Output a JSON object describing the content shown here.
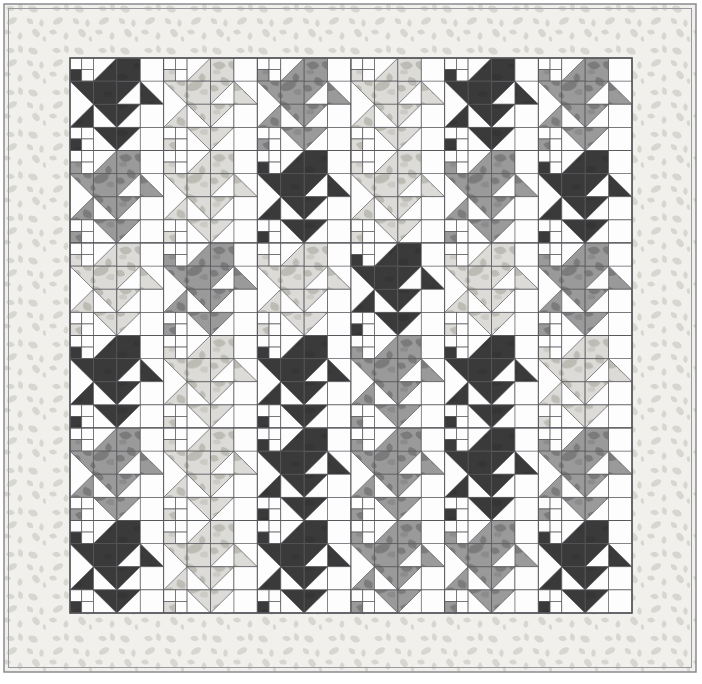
{
  "document": {
    "kind": "quilt-design-layout",
    "title": "Scottie Dog / Puppy Block Quilt Layout",
    "canvas": {
      "width": 702,
      "height": 684,
      "background": "#ffffff"
    }
  },
  "palette": {
    "dark": "#3a3a3a",
    "medium": "#9a9a9a",
    "medium_motif": "#7e7e7e",
    "light": "#dcdcd8",
    "light_motif": "#bcbcb6",
    "white": "#fdfdfd",
    "border_fabric": "#f1f0ec",
    "border_motif": "#d5d6cf",
    "seam_line": "#55555a",
    "outline": "#6b6b70"
  },
  "frame": {
    "outer": {
      "x": 4,
      "y": 4,
      "width": 692,
      "height": 668
    },
    "inner": {
      "x": 70,
      "y": 58,
      "width": 562,
      "height": 555
    },
    "border_width_left": 66,
    "border_width_top": 54,
    "border_width_right": 64,
    "border_width_bottom": 59
  },
  "quilt": {
    "block_columns": 6,
    "block_rows": 6,
    "block_width": 93.67,
    "block_height": 92.5,
    "units_per_block": 4,
    "block_name": "puppy-block"
  },
  "chart_data": {
    "type": "heatmap",
    "xlabel": "block column",
    "ylabel": "block row",
    "categories": [
      "C1",
      "C2",
      "C3",
      "C4",
      "C5",
      "C6"
    ],
    "rows": [
      "R1",
      "R2",
      "R3",
      "R4",
      "R5",
      "R6"
    ],
    "legend": [
      "dark",
      "medium",
      "light",
      "white"
    ],
    "values": [
      [
        "dark",
        "light",
        "medium",
        "light",
        "dark",
        "medium"
      ],
      [
        "medium",
        "light",
        "dark",
        "light",
        "medium",
        "dark"
      ],
      [
        "light",
        "medium",
        "light",
        "dark",
        "light",
        "medium"
      ],
      [
        "dark",
        "light",
        "dark",
        "medium",
        "dark",
        "light"
      ],
      [
        "medium",
        "light",
        "dark",
        "medium",
        "dark",
        "medium"
      ],
      [
        "dark",
        "light",
        "dark",
        "medium",
        "medium",
        "dark"
      ]
    ],
    "grid": true,
    "legend_position": "none"
  }
}
